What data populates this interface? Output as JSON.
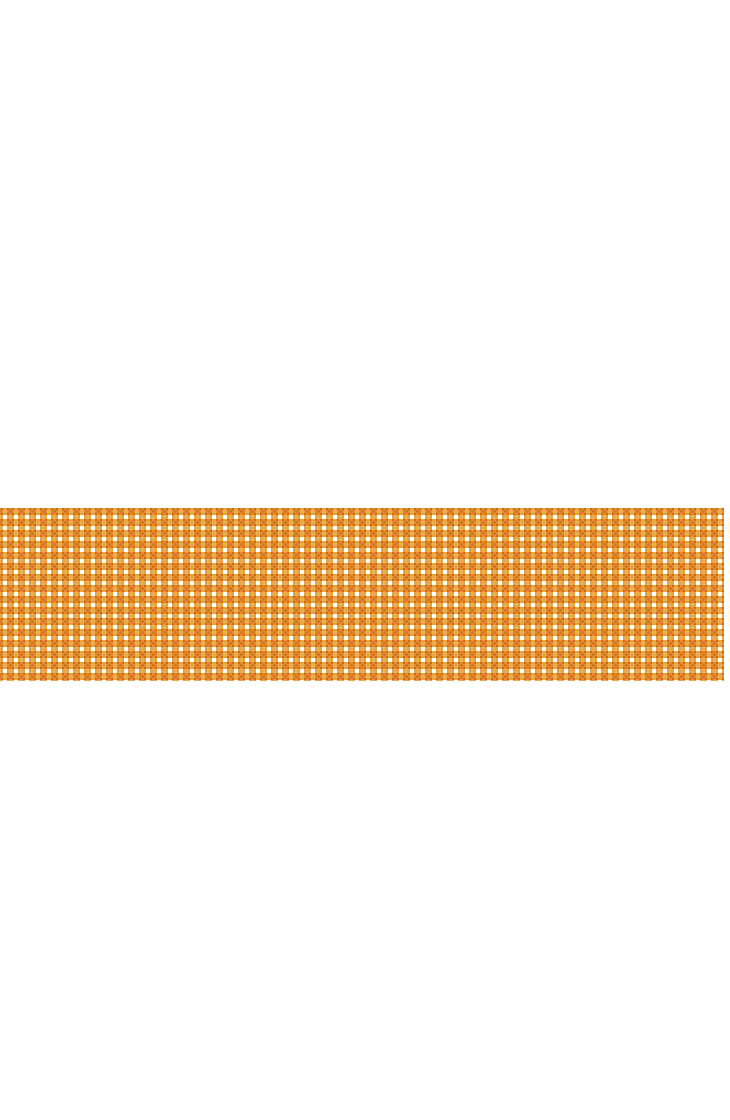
{
  "canvas": {
    "width": 730,
    "height": 1120,
    "background_color": "#ffffff"
  },
  "pattern_band": {
    "name": "checkered-pattern-band",
    "description": "Horizontal band of a regular orange square-dot grid pattern on a white background",
    "x": 0,
    "y": 508,
    "width": 724,
    "height": 173,
    "background_color": "#ffffff"
  },
  "pattern": {
    "type": "square-dot-grid",
    "cell_pitch_x": 11,
    "cell_pitch_y": 11,
    "dot_width": 7,
    "dot_height": 7,
    "gap": 4,
    "columns": 66,
    "rows": 16,
    "dot_color": "#e8a33d",
    "dot_color_light": "#f0bb68",
    "dot_color_dark": "#dd9a2e",
    "gutter_color": "#ffffff",
    "offset_x": -4,
    "offset_y": 0
  }
}
